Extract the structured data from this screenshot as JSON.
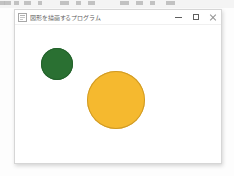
{
  "screen": {
    "width": 234,
    "height": 176,
    "background_color": "#fdfdfd"
  },
  "background_strip": {
    "description": "cut-off toolbar of another window at top edge",
    "background_color": "#f4f4f4",
    "glyph_color": "#b9b9b9"
  },
  "window": {
    "title": "図形を描画するプログラム",
    "icon": "app-icon",
    "background_color": "#ffffff",
    "border_color": "#d6d6d6",
    "controls": {
      "minimize_label": "—",
      "maximize_label": "□",
      "close_label": "✕"
    }
  },
  "canvas": {
    "background_color": "#ffffff",
    "shapes": [
      {
        "name": "green-circle",
        "type": "circle",
        "fill": "#2a7032",
        "stroke": "#23622b",
        "center_x": 42,
        "center_y": 39,
        "radius": 16
      },
      {
        "name": "yellow-circle",
        "type": "circle",
        "fill": "#f5b92f",
        "stroke": "#cf9a26",
        "center_x": 101,
        "center_y": 75,
        "radius": 29
      }
    ]
  }
}
